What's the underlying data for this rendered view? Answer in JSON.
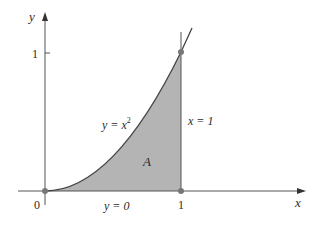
{
  "diagram": {
    "axes": {
      "x_label": "x",
      "y_label": "y",
      "origin_label": "0",
      "x_tick_label": "1",
      "y_tick_label": "1"
    },
    "curve": {
      "label_lhs": "y = x",
      "label_exp": "2",
      "equation": "y = x^2"
    },
    "boundaries": {
      "vertical_line_label": "x = 1",
      "bottom_line_label": "y = 0"
    },
    "region": {
      "label": "A"
    },
    "points": [
      {
        "name": "origin",
        "x": 0,
        "y": 0
      },
      {
        "name": "point-1-0",
        "x": 1,
        "y": 0
      },
      {
        "name": "point-1-1",
        "x": 1,
        "y": 1
      }
    ],
    "colors": {
      "fill": "#b4b4b4",
      "stroke": "#555555",
      "curve": "#444444",
      "point": "#777777"
    }
  }
}
